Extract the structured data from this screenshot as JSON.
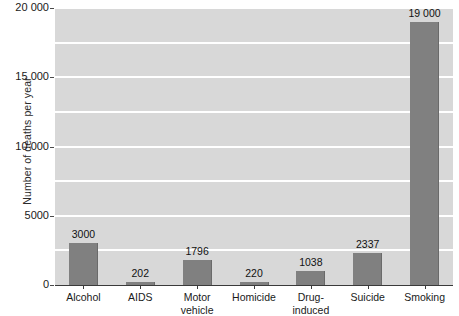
{
  "chart_data": {
    "type": "bar",
    "title": "",
    "subtitle": "",
    "xlabel": "",
    "ylabel": "Number of deaths per year",
    "ylim": [
      0,
      20000
    ],
    "xlim_note": "categorical",
    "grid": true,
    "grid_interval": 2500,
    "legend": "none",
    "categories": [
      "Alcohol",
      "AIDS",
      "Motor vehicle",
      "Homicide",
      "Drug-induced",
      "Suicide",
      "Smoking"
    ],
    "values": [
      3000,
      202,
      1796,
      220,
      1038,
      2337,
      19000
    ],
    "data_labels": [
      "3000",
      "202",
      "1796",
      "220",
      "1038",
      "2337",
      "19 000"
    ],
    "y_tick_values": [
      0,
      5000,
      10000,
      15000,
      20000
    ],
    "y_tick_labels": [
      "0",
      "5000",
      "10 000",
      "15 000",
      "20 000"
    ],
    "bar_color": "#808080",
    "plot_background_color": "#d8d8d8",
    "gridline_color": "#ffffff",
    "axis_color": "#3a3a3a",
    "text_color": "#1a1a1a"
  },
  "x_axis": {
    "labels": [
      {
        "lines": [
          "Alcohol"
        ]
      },
      {
        "lines": [
          "AIDS"
        ]
      },
      {
        "lines": [
          "Motor",
          "vehicle"
        ]
      },
      {
        "lines": [
          "Homicide"
        ]
      },
      {
        "lines": [
          "Drug-",
          "induced"
        ]
      },
      {
        "lines": [
          "Suicide"
        ]
      },
      {
        "lines": [
          "Smoking"
        ]
      }
    ]
  }
}
